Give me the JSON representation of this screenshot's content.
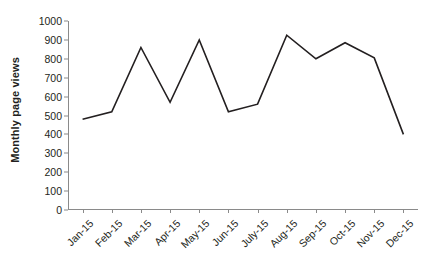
{
  "chart_data": {
    "type": "line",
    "title": "",
    "xlabel": "",
    "ylabel": "Monthly page views",
    "categories": [
      "Jan-15",
      "Feb-15",
      "Mar-15",
      "Apr-15",
      "May-15",
      "Jun-15",
      "July-15",
      "Aug-15",
      "Sep-15",
      "Oct-15",
      "Nov-15",
      "Dec-15"
    ],
    "values": [
      480,
      520,
      860,
      570,
      900,
      520,
      560,
      925,
      800,
      885,
      805,
      400
    ],
    "series": [
      {
        "name": "Monthly page views",
        "values": [
          480,
          520,
          860,
          570,
          900,
          520,
          560,
          925,
          800,
          885,
          805,
          400
        ]
      }
    ],
    "ylim": [
      0,
      1000
    ],
    "yticks": [
      0,
      100,
      200,
      300,
      400,
      500,
      600,
      700,
      800,
      900,
      1000
    ],
    "ytick_labels": [
      "0",
      "100",
      "200",
      "300",
      "400",
      "500",
      "600",
      "700",
      "800",
      "900",
      "1000"
    ],
    "grid": false,
    "legend": false,
    "legend_position": "none",
    "line_color": "#231f20",
    "axis_color": "#8a8a8a",
    "background_color": "#ffffff",
    "xtick_label_rotation": -45
  }
}
